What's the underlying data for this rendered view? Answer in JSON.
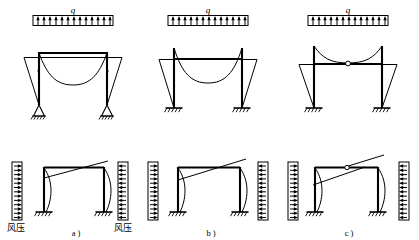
{
  "figure": {
    "stroke_color": "#000000",
    "background_color": "#ffffff",
    "panels": [
      {
        "id": "a",
        "label": "a )",
        "support_type": "pinned",
        "has_midspan_hinge": false,
        "top": {
          "load_label": "q",
          "load_type": "uniform-distributed-vertical",
          "arrow_count": 13,
          "arrow_direction": "up"
        },
        "bottom": {
          "left_load_label": "风压",
          "right_load_label": "风压",
          "left_arrow_direction": "right",
          "right_arrow_direction": "left",
          "arrow_count": 13
        }
      },
      {
        "id": "b",
        "label": "b )",
        "support_type": "fixed",
        "has_midspan_hinge": false,
        "top": {
          "load_label": "q",
          "load_type": "uniform-distributed-vertical",
          "arrow_count": 13,
          "arrow_direction": "up"
        },
        "bottom": {
          "left_load_label": "风压",
          "right_load_label": "风压",
          "left_arrow_direction": "right",
          "right_arrow_direction": "left",
          "arrow_count": 13
        }
      },
      {
        "id": "c",
        "label": "c )",
        "support_type": "fixed",
        "has_midspan_hinge": true,
        "top": {
          "load_label": "q",
          "load_type": "uniform-distributed-vertical",
          "arrow_count": 13,
          "arrow_direction": "up"
        },
        "bottom": {
          "left_load_label": "风压",
          "right_load_label": "风压",
          "left_arrow_direction": "right",
          "right_arrow_direction": "left",
          "arrow_count": 13
        }
      }
    ]
  },
  "labels": {
    "q": "q",
    "wind_pressure": "风压",
    "panel_a": "a )",
    "panel_b": "b )",
    "panel_c": "c )"
  }
}
